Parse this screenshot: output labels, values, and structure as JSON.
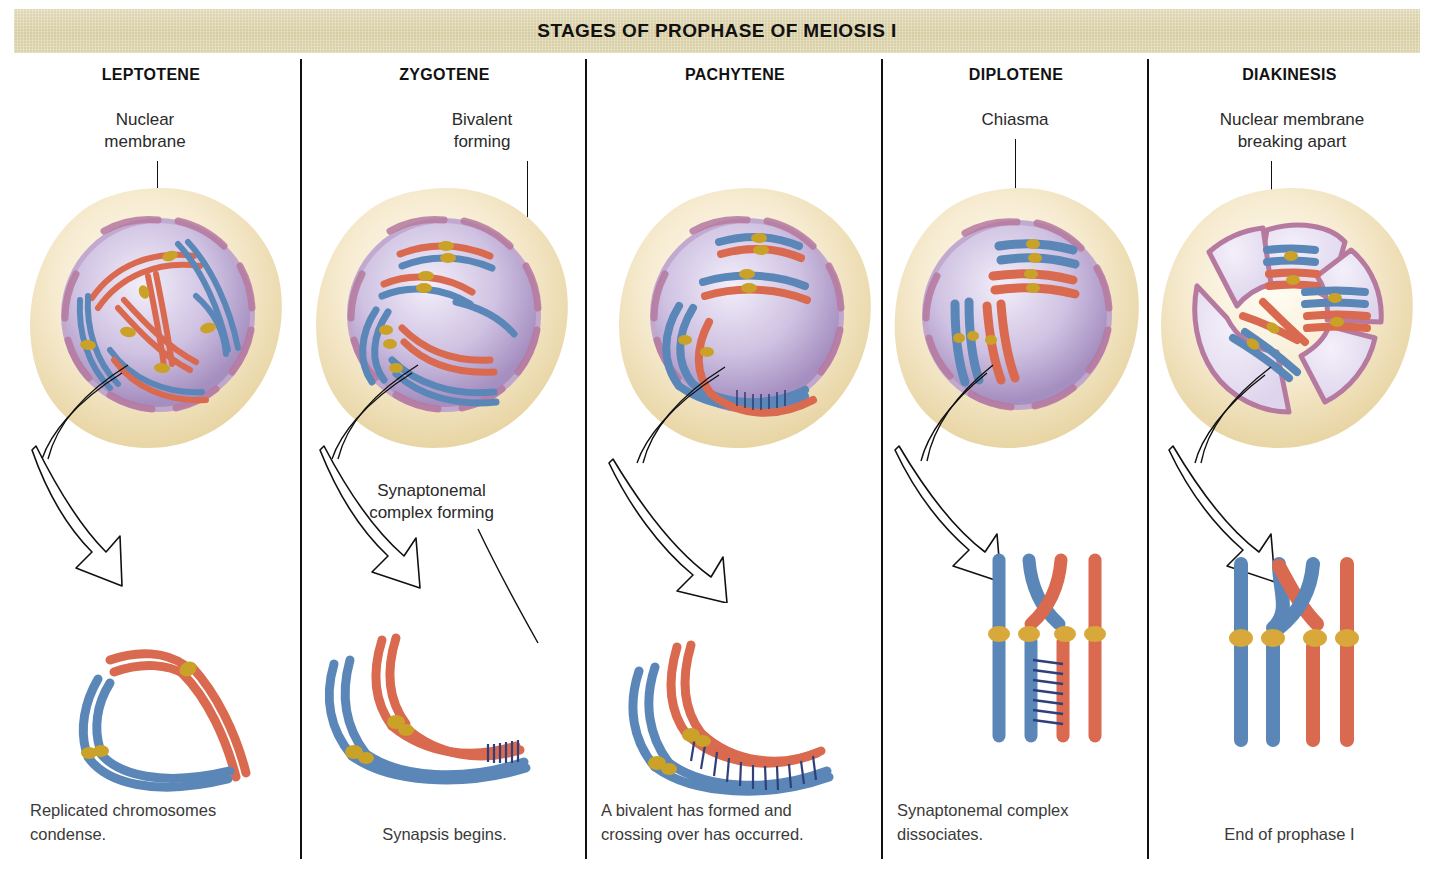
{
  "banner": {
    "title": "STAGES OF PROPHASE OF MEIOSIS I",
    "bg_color": "#e0d7b0"
  },
  "palette": {
    "chromosome_red": "#d9694f",
    "chromosome_blue": "#5b87b8",
    "centromere_gold": "#c9a227",
    "cytoplasm_cream": "#f5e9c8",
    "nucleus_purple": "#a98fc0",
    "nuclear_envelope_mauve": "#b6799f",
    "divider_black": "#111111",
    "text_dark": "#2a2a2a"
  },
  "columns": [
    {
      "id": "leptotene",
      "stage": "LEPTOTENE",
      "callout": "Nuclear\nmembrane",
      "callout2": null,
      "caption": "Replicated chromosomes\ncondense.",
      "caption_align": "left",
      "cell_description": "Intact round nucleus with long thin uncondensed duplicated chromosomes, red and blue, each with gold centromere",
      "detail_description": "Two replicated chromosomes shown as loose loops: one red pair and one blue pair, each joined at a gold centromere"
    },
    {
      "id": "zygotene",
      "stage": "ZYGOTENE",
      "callout": "Bivalent\nforming",
      "callout2": "Synaptonemal\ncomplex forming",
      "caption": "Synapsis begins.",
      "caption_align": "center",
      "cell_description": "Intact nucleus; homologous red and blue chromosomes beginning to pair along their lengths",
      "detail_description": "Red homolog pair aligning with blue homolog pair; short ladder of synaptonemal complex forming at right end"
    },
    {
      "id": "pachytene",
      "stage": "PACHYTENE",
      "callout": null,
      "callout2": null,
      "caption": "A bivalent has formed and\ncrossing over has occurred.",
      "caption_align": "left",
      "cell_description": "Intact nucleus with fully synapsed bivalents; red and blue homologs paired along their entire length",
      "detail_description": "Fully formed bivalent: red and blue homologs joined along their full length by a dark synaptonemal complex ladder"
    },
    {
      "id": "diplotene",
      "stage": "DIPLOTENE",
      "callout": "Chiasma",
      "callout2": null,
      "caption": "Synaptonemal complex\ndissociates.",
      "caption_align": "left",
      "cell_description": "Nucleus with condensed bivalents separating, chiasmata visible holding homologs together",
      "detail_description": "Blue and red homologs pulling apart, crossed at a chiasma; remnant of synaptonemal complex ladder still visible below the centromeres"
    },
    {
      "id": "diakinesis",
      "stage": "DIAKINESIS",
      "callout": "Nuclear membrane\nbreaking apart",
      "callout2": null,
      "caption": "End of prophase I",
      "caption_align": "center",
      "cell_description": "Nuclear envelope fragmenting into wedge-shaped pieces; highly condensed bivalents free in the cytoplasm",
      "detail_description": "Two fully condensed bivalents: blue homolog pair and red homolog pair, arms crossed over at the top, gold centromeres"
    }
  ]
}
